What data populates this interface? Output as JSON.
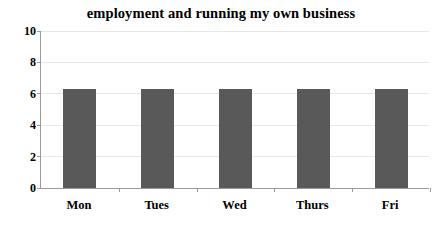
{
  "chart_data": {
    "type": "bar",
    "title": "employment and running my own business",
    "xlabel": "",
    "ylabel": "",
    "categories": [
      "Mon",
      "Tues",
      "Wed",
      "Thurs",
      "Fri"
    ],
    "values": [
      6.3,
      6.3,
      6.3,
      6.3,
      6.3
    ],
    "ylim": [
      0,
      10
    ],
    "ytick_labels": [
      "10",
      "8",
      "6",
      "4",
      "2",
      "0"
    ],
    "ytick_values": [
      10,
      8,
      6,
      4,
      2,
      0
    ],
    "grid": true,
    "legend": false,
    "legend_position": "none",
    "bar_color": "#595959",
    "grid_color": "#e8e8e8",
    "axis_color": "#9a9a9a",
    "background_color": "#ffffff",
    "text_color": "#000000"
  }
}
